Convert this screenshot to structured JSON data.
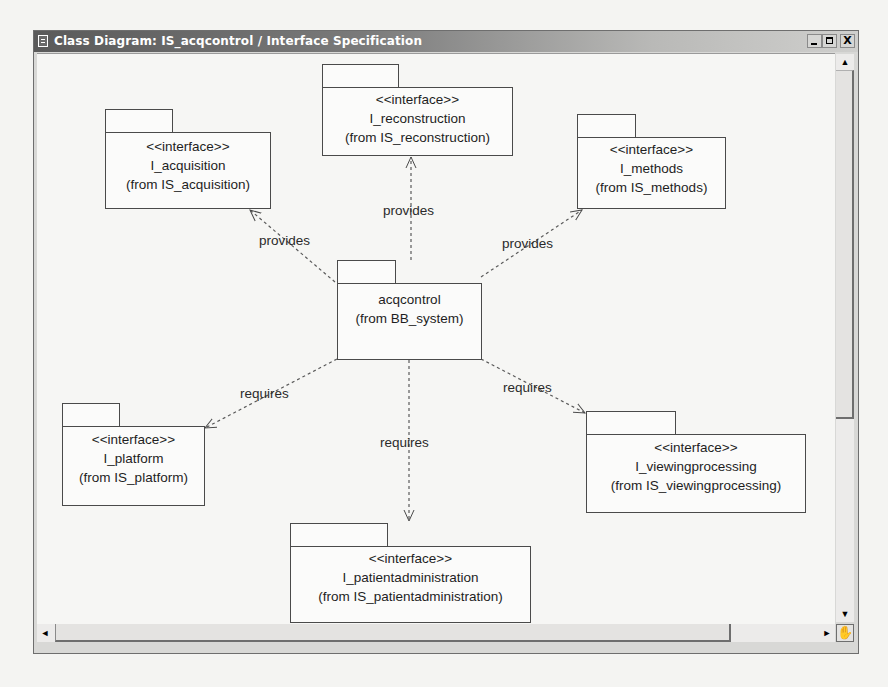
{
  "window": {
    "title": "Class Diagram: IS_acqcontrol / Interface Specification",
    "controls": {
      "minimize": "_",
      "maximize": "□",
      "close": "X"
    }
  },
  "scrollbars": {
    "vertical": {
      "up": "▲",
      "down": "▼"
    },
    "horizontal": {
      "left": "◄",
      "right": "►"
    },
    "corner_icon": "hand-pan-icon",
    "corner_glyph": "✋"
  },
  "diagram": {
    "center": {
      "name": "acqcontrol",
      "origin": "(from BB_system)"
    },
    "packages": [
      {
        "id": "acquisition",
        "stereotype": "<<interface>>",
        "name": "I_acquisition",
        "origin": "(from IS_acquisition)"
      },
      {
        "id": "reconstruction",
        "stereotype": "<<interface>>",
        "name": "I_reconstruction",
        "origin": "(from IS_reconstruction)"
      },
      {
        "id": "methods",
        "stereotype": "<<interface>>",
        "name": "I_methods",
        "origin": "(from IS_methods)"
      },
      {
        "id": "platform",
        "stereotype": "<<interface>>",
        "name": "I_platform",
        "origin": "(from IS_platform)"
      },
      {
        "id": "viewingprocessing",
        "stereotype": "<<interface>>",
        "name": "I_viewingprocessing",
        "origin": "(from IS_viewingprocessing)"
      },
      {
        "id": "patientadministration",
        "stereotype": "<<interface>>",
        "name": "I_patientadministration",
        "origin": "(from IS_patientadministration)"
      }
    ],
    "edges": [
      {
        "from": "acqcontrol",
        "to": "I_acquisition",
        "label": "provides"
      },
      {
        "from": "acqcontrol",
        "to": "I_reconstruction",
        "label": "provides"
      },
      {
        "from": "acqcontrol",
        "to": "I_methods",
        "label": "provides"
      },
      {
        "from": "acqcontrol",
        "to": "I_platform",
        "label": "requires"
      },
      {
        "from": "acqcontrol",
        "to": "I_patientadministration",
        "label": "requires"
      },
      {
        "from": "acqcontrol",
        "to": "I_viewingprocessing",
        "label": "requires"
      }
    ]
  },
  "colors": {
    "titlebar_start": "#5a5a5a",
    "titlebar_end": "#cfcfcd",
    "canvas": "#f6f6f4",
    "line": "#4a4a4a"
  }
}
